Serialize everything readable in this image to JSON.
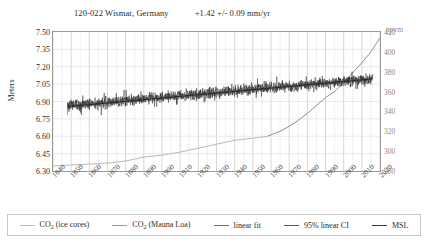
{
  "chart_data": {
    "type": "line",
    "station_id": "120-022 Wismar, Germany",
    "trend": "+1.42 +/- 0.09 mm/yr",
    "xlabel": "",
    "ylabel": "Meters",
    "y2label": "ppvm",
    "xlim": [
      1840,
      2020
    ],
    "ylim": [
      6.3,
      7.5
    ],
    "y2lim": [
      280,
      420
    ],
    "grid": true,
    "legend_position": "bottom",
    "x_ticks": [
      "1840",
      "1850",
      "1860",
      "1870",
      "1880",
      "1890",
      "1900",
      "1910",
      "1920",
      "1930",
      "1940",
      "1950",
      "1960",
      "1970",
      "1980",
      "1990",
      "2000",
      "2010",
      "2020"
    ],
    "y_ticks_left": [
      "7.50",
      "7.35",
      "7.20",
      "7.05",
      "6.90",
      "6.75",
      "6.60",
      "6.45",
      "6.30"
    ],
    "y_ticks_right": [
      "420",
      "400",
      "380",
      "360",
      "340",
      "320",
      "300",
      "280"
    ],
    "series": [
      {
        "name": "CO2 (ice cores)",
        "axis": "right",
        "color": "#b9b9b9",
        "x": [
          1840,
          1850,
          1860,
          1870,
          1880,
          1890,
          1900,
          1910,
          1920,
          1930,
          1940,
          1950,
          1958
        ],
        "values": [
          285,
          286,
          287,
          288,
          290,
          294,
          296,
          299,
          303,
          307,
          311,
          313,
          315
        ]
      },
      {
        "name": "CO2 (Mauna Loa)",
        "axis": "right",
        "color": "#8e8e8e",
        "x": [
          1958,
          1965,
          1970,
          1975,
          1980,
          1985,
          1990,
          1995,
          2000,
          2005,
          2010,
          2015,
          2020
        ],
        "values": [
          315,
          320,
          325,
          331,
          338,
          346,
          354,
          360,
          369,
          379,
          389,
          400,
          414
        ]
      },
      {
        "name": "linear fit",
        "axis": "left",
        "color": "#2b2b2b",
        "x": [
          1848,
          2016
        ],
        "values": [
          6.856,
          7.095
        ]
      },
      {
        "name": "95% linear CI",
        "axis": "left",
        "color": "#5a5a5a",
        "x": [
          1848,
          2016
        ],
        "values": [
          6.856,
          7.095
        ]
      },
      {
        "name": "MSL",
        "axis": "left",
        "color": "#1a1a1a",
        "description": "monthly mean sea level, noisy series 1848-2016 centered near 6.88-7.05 m",
        "x_start": 1848,
        "x_end": 2016,
        "mean_start": 6.865,
        "mean_end": 7.095,
        "noise_amplitude": 0.11
      }
    ]
  },
  "legend": {
    "items": [
      {
        "label_pre": "CO",
        "sub": "2",
        "label_post": " (ice cores)",
        "color": "#bdbdbd",
        "name": "co2-ice-cores"
      },
      {
        "label_pre": "CO",
        "sub": "2",
        "label_post": " (Mauna Loa)",
        "color": "#9a9a9a",
        "name": "co2-mauna-loa"
      },
      {
        "label_pre": "linear fit",
        "sub": "",
        "label_post": "",
        "color": "#6f6f6f",
        "name": "linear-fit"
      },
      {
        "label_pre": "95% linear CI",
        "sub": "",
        "label_post": "",
        "color": "#5a5a5a",
        "name": "linear-ci"
      },
      {
        "label_pre": "MSL",
        "sub": "",
        "label_post": "",
        "color": "#3a3a3a",
        "name": "msl"
      }
    ]
  }
}
